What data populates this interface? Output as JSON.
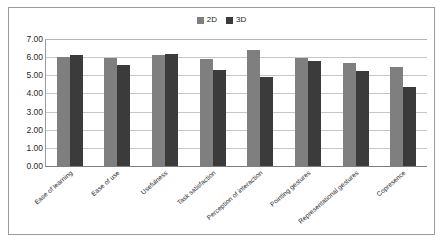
{
  "chart_data": {
    "type": "bar",
    "title": "",
    "xlabel": "",
    "ylabel": "",
    "ylim": [
      0,
      7
    ],
    "ytick_labels": [
      "7.00",
      "6.00",
      "5.00",
      "4.00",
      "3.00",
      "2.00",
      "1.00",
      "0.00"
    ],
    "ytick_values": [
      7,
      6,
      5,
      4,
      3,
      2,
      1,
      0
    ],
    "grid": true,
    "legend_position": "top-center",
    "categories": [
      "Ease of learning",
      "Ease of use",
      "Usefulness",
      "Task satisfaction",
      "Perception of interaction",
      "Pointing gestures",
      "Representational gestures",
      "Copresence"
    ],
    "series": [
      {
        "name": "2D",
        "color": "#7f7f7f",
        "values": [
          6.0,
          5.98,
          6.12,
          5.88,
          6.42,
          5.95,
          5.67,
          5.45
        ]
      },
      {
        "name": "3D",
        "color": "#3b3b3b",
        "values": [
          6.1,
          5.55,
          6.18,
          5.28,
          4.92,
          5.78,
          5.23,
          4.35
        ]
      }
    ]
  },
  "colors": {
    "series_2d": "#7f7f7f",
    "series_3d": "#3b3b3b",
    "gridline": "#c6c6c6",
    "axis": "#7d7d7d",
    "frame_border": "#9a9a9a",
    "text": "#2a2a2a",
    "background": "#ffffff"
  }
}
